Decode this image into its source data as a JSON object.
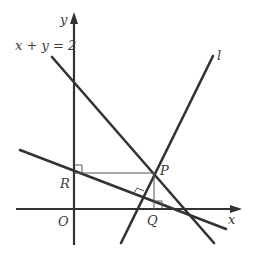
{
  "diagram": {
    "type": "coordinate-geometry",
    "axes": {
      "x_label": "x",
      "y_label": "y",
      "origin_label": "O"
    },
    "lines": [
      {
        "id": "line-x-plus-y",
        "label": "x + y = 2"
      },
      {
        "id": "line-l",
        "label": "l"
      },
      {
        "id": "line-through-R",
        "label": ""
      }
    ],
    "points": [
      {
        "id": "P",
        "label": "P"
      },
      {
        "id": "Q",
        "label": "Q"
      },
      {
        "id": "R",
        "label": "R"
      },
      {
        "id": "O",
        "label": "O"
      }
    ],
    "right_angles": [
      "at R between y-axis and PR",
      "at Q between PQ and x-axis",
      "between line l and line through R"
    ],
    "colors": {
      "stroke": "#333333",
      "background": "#ffffff"
    }
  }
}
